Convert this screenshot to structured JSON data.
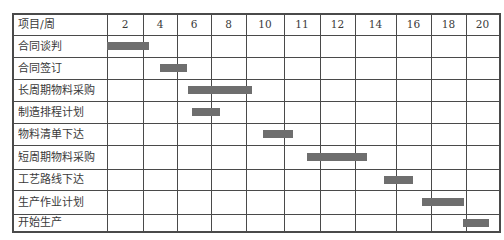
{
  "chart_data": {
    "type": "gantt",
    "title": "",
    "header_label": "项目/周",
    "x_ticks": [
      "2",
      "4",
      "6",
      "8",
      "10",
      "11",
      "12",
      "14",
      "16",
      "18",
      "20"
    ],
    "tasks": [
      {
        "name": "合同谈判",
        "start_col": 0.0,
        "end_col": 1.17
      },
      {
        "name": "合同签订",
        "start_col": 1.5,
        "end_col": 2.3
      },
      {
        "name": "长周期物料采购",
        "start_col": 2.32,
        "end_col": 4.15
      },
      {
        "name": "制造排程计划",
        "start_col": 2.45,
        "end_col": 3.25
      },
      {
        "name": "物料清单下达",
        "start_col": 4.45,
        "end_col": 5.25
      },
      {
        "name": "短周期物料采购",
        "start_col": 5.65,
        "end_col": 7.3
      },
      {
        "name": "工艺路线下达",
        "start_col": 7.7,
        "end_col": 8.5
      },
      {
        "name": "生产作业计划",
        "start_col": 8.75,
        "end_col": 9.95
      },
      {
        "name": "开始生产",
        "start_col": 9.9,
        "end_col": 10.7
      }
    ],
    "grid": true,
    "legend": "none",
    "bar_color": "#6e6e6e",
    "grid_color": "#4a4a4a"
  },
  "layout": {
    "col_edges": [
      12,
      107,
      143,
      177,
      211,
      246,
      284,
      320,
      355,
      396,
      431,
      466,
      499
    ],
    "row_edges": [
      13,
      35,
      57,
      79,
      101,
      123,
      145,
      169,
      190,
      214,
      231
    ]
  }
}
